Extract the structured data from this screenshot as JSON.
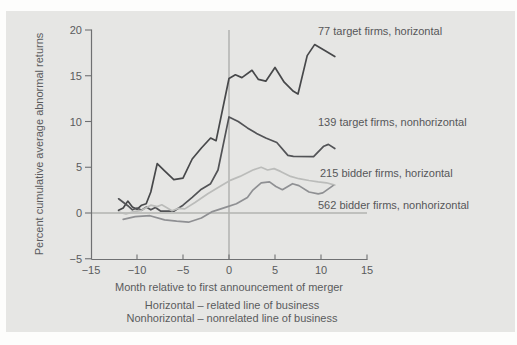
{
  "figure": {
    "panel_background": "#e6e6e4",
    "page_background": "#fdfdfc",
    "axis_color": "#6f7072",
    "reference_line_color": "#a4a5a3",
    "zero_line_color": "#b2b3b1",
    "text_color": "#5a5b5d"
  },
  "chart_data": {
    "type": "line",
    "title": "",
    "xlabel": "Month relative to first announcement of merger",
    "ylabel": "Percent cumulative average abnormal returns",
    "xlim": [
      -15,
      15
    ],
    "ylim": [
      -5,
      20
    ],
    "grid": false,
    "legend_position": "inline-labels-right",
    "reference_lines": [
      {
        "axis": "vertical",
        "value": 0
      },
      {
        "axis": "horizontal",
        "value": 0
      }
    ],
    "x_ticks": [
      {
        "value": -15,
        "label": "−15"
      },
      {
        "value": -10,
        "label": "−10"
      },
      {
        "value": -5,
        "label": "−5"
      },
      {
        "value": 0,
        "label": "0"
      },
      {
        "value": 5,
        "label": "5"
      },
      {
        "value": 10,
        "label": "10"
      },
      {
        "value": 15,
        "label": "15"
      }
    ],
    "y_ticks": [
      {
        "value": 20,
        "label": "20"
      },
      {
        "value": 15,
        "label": "15"
      },
      {
        "value": 10,
        "label": "10"
      },
      {
        "value": 5,
        "label": "5"
      },
      {
        "value": 0,
        "label": "0"
      },
      {
        "value": -5,
        "label": "−5"
      }
    ],
    "series": [
      {
        "name": "77 target firms, horizontal",
        "color": "#47484a",
        "points": [
          [
            -12,
            0.3
          ],
          [
            -11.5,
            0.55
          ],
          [
            -11,
            1.3
          ],
          [
            -10.5,
            0.65
          ],
          [
            -10,
            0.4
          ],
          [
            -9.5,
            0.85
          ],
          [
            -9,
            1.0
          ],
          [
            -8.5,
            2.3
          ],
          [
            -7.8,
            5.4
          ],
          [
            -7,
            4.6
          ],
          [
            -6,
            3.65
          ],
          [
            -5,
            3.8
          ],
          [
            -4,
            5.9
          ],
          [
            -3,
            7.1
          ],
          [
            -2,
            8.2
          ],
          [
            -1.4,
            7.9
          ],
          [
            0,
            14.7
          ],
          [
            0.7,
            15.1
          ],
          [
            1.4,
            14.8
          ],
          [
            2.5,
            15.6
          ],
          [
            3.2,
            14.6
          ],
          [
            4,
            14.4
          ],
          [
            5,
            15.9
          ],
          [
            6,
            14.3
          ],
          [
            7,
            13.3
          ],
          [
            7.5,
            13.0
          ],
          [
            8.5,
            17.2
          ],
          [
            9.3,
            18.4
          ],
          [
            10.5,
            17.7
          ],
          [
            11.5,
            17.1
          ]
        ]
      },
      {
        "name": "139 target firms, nonhorizontal",
        "color": "#525356",
        "points": [
          [
            -12,
            1.55
          ],
          [
            -11,
            0.8
          ],
          [
            -10.5,
            0.35
          ],
          [
            -10,
            0.55
          ],
          [
            -9.5,
            0.3
          ],
          [
            -9,
            0.65
          ],
          [
            -8.5,
            0.35
          ],
          [
            -8,
            0.6
          ],
          [
            -7.4,
            0.2
          ],
          [
            -6,
            0.2
          ],
          [
            -5,
            0.85
          ],
          [
            -4,
            1.7
          ],
          [
            -3,
            2.6
          ],
          [
            -2,
            3.2
          ],
          [
            -1.2,
            4.7
          ],
          [
            0,
            10.5
          ],
          [
            1,
            10.0
          ],
          [
            2,
            9.3
          ],
          [
            3,
            8.7
          ],
          [
            4,
            8.2
          ],
          [
            5.2,
            7.7
          ],
          [
            6.4,
            6.3
          ],
          [
            7,
            6.2
          ],
          [
            9.2,
            6.15
          ],
          [
            10.3,
            7.3
          ],
          [
            10.8,
            7.5
          ],
          [
            11.5,
            7.05
          ]
        ]
      },
      {
        "name": "215 bidder firms, horizontal",
        "color": "#bbbcba",
        "points": [
          [
            -12,
            0.1
          ],
          [
            -11.2,
            -0.1
          ],
          [
            -10.3,
            0.15
          ],
          [
            -9.5,
            0.3
          ],
          [
            -8.5,
            0.85
          ],
          [
            -7.8,
            0.7
          ],
          [
            -7.3,
            0.9
          ],
          [
            -6.2,
            0.25
          ],
          [
            -5.5,
            0.5
          ],
          [
            -4.8,
            0.45
          ],
          [
            -3.7,
            1.15
          ],
          [
            -2.3,
            2.1
          ],
          [
            -1,
            2.9
          ],
          [
            0.2,
            3.6
          ],
          [
            1.2,
            4.0
          ],
          [
            2.6,
            4.7
          ],
          [
            3.5,
            5.0
          ],
          [
            4.2,
            4.7
          ],
          [
            4.9,
            4.85
          ],
          [
            5.6,
            4.55
          ],
          [
            6.7,
            4.0
          ],
          [
            7.6,
            3.75
          ],
          [
            8.7,
            3.55
          ],
          [
            9.7,
            3.4
          ],
          [
            10.6,
            3.3
          ],
          [
            11.5,
            3.05
          ]
        ]
      },
      {
        "name": "562 bidder firms, nonhorizontal",
        "color": "#8f9093",
        "points": [
          [
            -11.5,
            -0.7
          ],
          [
            -10.2,
            -0.4
          ],
          [
            -8.6,
            -0.3
          ],
          [
            -7,
            -0.75
          ],
          [
            -5.7,
            -0.9
          ],
          [
            -4.4,
            -1.0
          ],
          [
            -3,
            -0.55
          ],
          [
            -1.8,
            0.15
          ],
          [
            -0.3,
            0.65
          ],
          [
            0.8,
            1.0
          ],
          [
            2,
            1.7
          ],
          [
            2.6,
            2.5
          ],
          [
            3.5,
            3.3
          ],
          [
            4.4,
            3.4
          ],
          [
            5.1,
            2.9
          ],
          [
            5.8,
            2.55
          ],
          [
            6.9,
            3.2
          ],
          [
            7.6,
            3.0
          ],
          [
            8.7,
            2.3
          ],
          [
            9.7,
            2.1
          ],
          [
            10.2,
            2.2
          ],
          [
            11.3,
            3.0
          ]
        ]
      }
    ],
    "footnotes": [
      "Horizontal – related line of business",
      "Nonhorizontal – nonrelated line of business"
    ]
  }
}
